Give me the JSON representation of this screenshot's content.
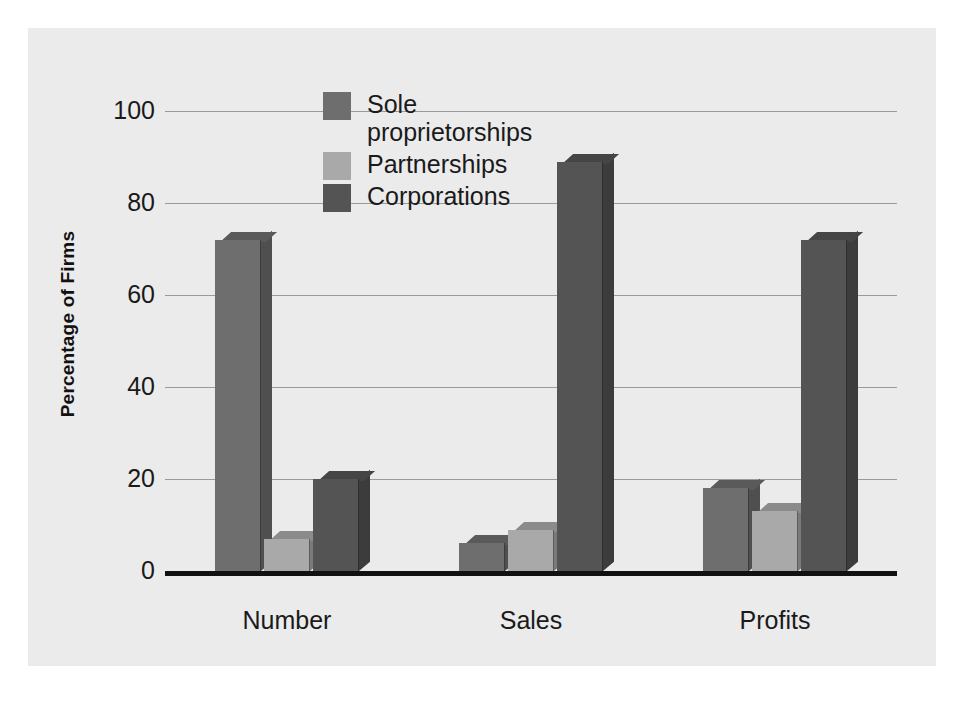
{
  "chart_data": {
    "type": "bar",
    "title": "",
    "xlabel": "",
    "ylabel": "Percentage of Firms",
    "categories": [
      "Number",
      "Sales",
      "Profits"
    ],
    "series": [
      {
        "name": "Sole proprietorships",
        "values": [
          72,
          6,
          18
        ],
        "color": "#6e6e6e"
      },
      {
        "name": "Partnerships",
        "values": [
          7,
          9,
          13
        ],
        "color": "#a9a9a9"
      },
      {
        "name": "Corporations",
        "values": [
          20,
          89,
          72
        ],
        "color": "#545454"
      }
    ],
    "ylim": [
      0,
      100
    ],
    "yticks": [
      "0",
      "20",
      "40",
      "60",
      "80",
      "100"
    ],
    "grid": true,
    "legend_position": "top-center",
    "legend": [
      "Sole\nproprietorships",
      "Partnerships",
      "Corporations"
    ]
  },
  "colors": {
    "panel_background": "#ebebeb",
    "page_background": "#ffffff",
    "gridline": "#9a9a9a",
    "axis": "#111111",
    "text": "#1a1a1a",
    "sole_proprietorships": "#6e6e6e",
    "partnerships": "#a9a9a9",
    "corporations": "#545454"
  }
}
